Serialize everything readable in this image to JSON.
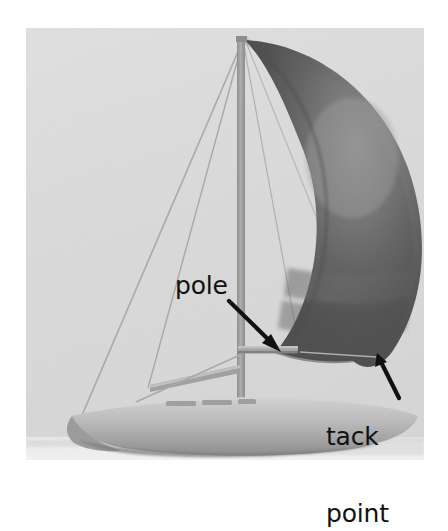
{
  "figure": {
    "background_color": "#ffffff",
    "photo": {
      "left": 26,
      "top": 28,
      "width": 398,
      "height": 432,
      "sky_color": "#dcdcdc",
      "water_color": "#e8e8e8"
    },
    "annotations": [
      {
        "id": "pole",
        "label": "pole",
        "text_x": 175,
        "text_y": 273,
        "font_size": 25,
        "color": "#111111",
        "arrow": {
          "x1": 229,
          "y1": 301,
          "x2": 280,
          "y2": 351
        }
      },
      {
        "id": "tack-point",
        "label_line1": "tack",
        "label_line2": "point",
        "text_x": 326,
        "text_y": 373,
        "font_size": 25,
        "color": "#111111",
        "arrow": {
          "x1": 398,
          "y1": 397,
          "x2": 377,
          "y2": 354
        }
      }
    ],
    "boat": {
      "mast": {
        "x": 241,
        "top_y": 38,
        "bottom_y": 400,
        "color": "#9a9a9a"
      },
      "masthead_y": 38,
      "pole": {
        "x1": 239,
        "x2": 297,
        "y": 350,
        "color": "#9a9a9a"
      },
      "boom": {
        "x1": 152,
        "y1": 388,
        "x2": 240,
        "y2": 368,
        "color": "#8f8f8f"
      },
      "hull_color": "#b9b9b9",
      "hull_shadow_color": "#8a8a8a",
      "deck_color": "#cfcfcf",
      "spinnaker": {
        "fill_dark": "#595959",
        "fill_mid": "#6e6e6e",
        "fill_light": "#8a8a8a",
        "tack_x": 377,
        "tack_y": 354,
        "head_x": 245,
        "head_y": 40
      },
      "rigging_color": "#9d9d9d"
    }
  }
}
